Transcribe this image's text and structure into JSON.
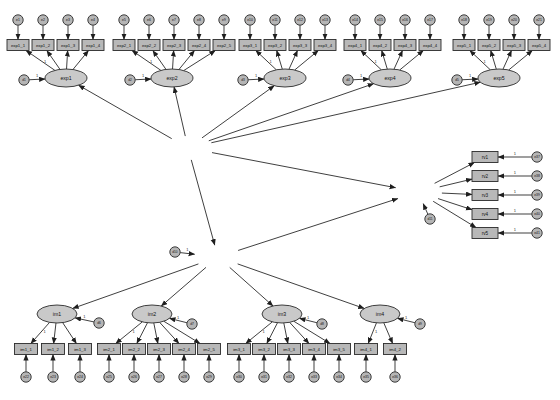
{
  "figure": {
    "kind": "sem-path-diagram",
    "title": "",
    "background_color": "#ffffff",
    "shape_fill_rect": "#b8b8b8",
    "shape_fill_ellipse": "#c9c9c9",
    "shape_fill_circle": "#b5b5b5",
    "stroke_color": "#1e1e1e",
    "edge_label": "1"
  },
  "latents": {
    "second_order": [
      {
        "id": "exp",
        "label": "exp",
        "x": 188,
        "y": 148,
        "rx": 26,
        "ry": 12
      },
      {
        "id": "im",
        "label": "im",
        "x": 218,
        "y": 257,
        "rx": 24,
        "ry": 12
      },
      {
        "id": "rv",
        "label": "rv",
        "x": 418,
        "y": 192,
        "rx": 24,
        "ry": 12
      }
    ],
    "first_order": [
      {
        "id": "exp1",
        "label": "exp1",
        "x": 66,
        "y": 78,
        "rx": 21,
        "ry": 9
      },
      {
        "id": "exp2",
        "label": "exp2",
        "x": 172,
        "y": 78,
        "rx": 21,
        "ry": 9
      },
      {
        "id": "exp3",
        "label": "exp3",
        "x": 285,
        "y": 78,
        "rx": 21,
        "ry": 9
      },
      {
        "id": "exp4",
        "label": "exp4",
        "x": 390,
        "y": 78,
        "rx": 21,
        "ry": 9
      },
      {
        "id": "exp5",
        "label": "exp5",
        "x": 499,
        "y": 78,
        "rx": 21,
        "ry": 9
      },
      {
        "id": "im1",
        "label": "im1",
        "x": 57,
        "y": 314,
        "rx": 20,
        "ry": 9
      },
      {
        "id": "im2",
        "label": "im2",
        "x": 152,
        "y": 314,
        "rx": 20,
        "ry": 9
      },
      {
        "id": "im3",
        "label": "im3",
        "x": 282,
        "y": 314,
        "rx": 20,
        "ry": 9
      },
      {
        "id": "im4",
        "label": "im4",
        "x": 380,
        "y": 314,
        "rx": 20,
        "ry": 9
      }
    ]
  },
  "indicator_groups": [
    {
      "factor": "exp1",
      "indicators": [
        "exp1_1",
        "exp1_2",
        "exp1_3",
        "exp1_4"
      ],
      "errors": [
        "e1",
        "e2",
        "e3",
        "e4"
      ],
      "disturbance": "d1",
      "box_y": 45,
      "err_y": 20,
      "x_start": 18,
      "x_step": 25,
      "box_w": 22,
      "box_h": 11
    },
    {
      "factor": "exp2",
      "indicators": [
        "exp2_1",
        "exp2_2",
        "exp2_3",
        "exp2_4",
        "exp2_5"
      ],
      "errors": [
        "e5",
        "e6",
        "e7",
        "e8",
        "e9"
      ],
      "disturbance": "d2",
      "box_y": 45,
      "err_y": 20,
      "x_start": 124,
      "x_step": 25,
      "box_w": 22,
      "box_h": 11
    },
    {
      "factor": "exp3",
      "indicators": [
        "exp3_1",
        "exp3_2",
        "exp3_3",
        "exp3_4"
      ],
      "errors": [
        "e10",
        "e11",
        "e12",
        "e13"
      ],
      "disturbance": "d3",
      "box_y": 45,
      "err_y": 20,
      "x_start": 250,
      "x_step": 25,
      "box_w": 22,
      "box_h": 11
    },
    {
      "factor": "exp4",
      "indicators": [
        "exp4_1",
        "exp4_2",
        "exp4_3",
        "exp4_4"
      ],
      "errors": [
        "e14",
        "e15",
        "e16",
        "e17"
      ],
      "disturbance": "d4",
      "box_y": 45,
      "err_y": 20,
      "x_start": 355,
      "x_step": 25,
      "box_w": 22,
      "box_h": 11
    },
    {
      "factor": "exp5",
      "indicators": [
        "exp5_1",
        "exp5_2",
        "exp5_3",
        "exp5_4"
      ],
      "errors": [
        "e18",
        "e19",
        "e20",
        "e21"
      ],
      "disturbance": "d5",
      "box_y": 45,
      "err_y": 20,
      "x_start": 464,
      "x_step": 25,
      "box_w": 22,
      "box_h": 11
    },
    {
      "factor": "im1",
      "indicators": [
        "im1_1",
        "im1_2",
        "im1_3"
      ],
      "errors": [
        "e22",
        "e23",
        "e24"
      ],
      "disturbance": "d6",
      "box_y": 349,
      "err_y": 377,
      "x_start": 26,
      "x_step": 27,
      "box_w": 23,
      "box_h": 11
    },
    {
      "factor": "im2",
      "indicators": [
        "im2_1",
        "im2_2",
        "im2_3",
        "im2_4",
        "im2_5"
      ],
      "errors": [
        "e25",
        "e26",
        "e27",
        "e28",
        "e29"
      ],
      "disturbance": "d7",
      "box_y": 349,
      "err_y": 377,
      "x_start": 109,
      "x_step": 25,
      "box_w": 23,
      "box_h": 11
    },
    {
      "factor": "im3",
      "indicators": [
        "im3_1",
        "im3_2",
        "im3_3",
        "im3_4",
        "im3_5"
      ],
      "errors": [
        "e30",
        "e31",
        "e32",
        "e33",
        "e34"
      ],
      "disturbance": "d8",
      "box_y": 349,
      "err_y": 377,
      "x_start": 239,
      "x_step": 25,
      "box_w": 23,
      "box_h": 11
    },
    {
      "factor": "im4",
      "indicators": [
        "im4_1",
        "im4_2"
      ],
      "errors": [
        "e35",
        "e36"
      ],
      "disturbance": "d9",
      "box_y": 349,
      "err_y": 377,
      "x_start": 366,
      "x_step": 29,
      "box_w": 23,
      "box_h": 11
    }
  ],
  "rv_block": {
    "factor": "rv",
    "indicators": [
      "rv1",
      "rv2",
      "rv3",
      "rv4",
      "rv5"
    ],
    "errors": [
      "e37",
      "e38",
      "e39",
      "e40",
      "e41"
    ],
    "disturbance": "d11",
    "box_x": 485,
    "box_w": 26,
    "box_h": 11,
    "err_x": 537,
    "y_start": 157,
    "y_step": 19
  },
  "im_disturbance": {
    "id": "d10",
    "x": 175,
    "y": 252
  },
  "structural_paths": [
    {
      "from": "exp",
      "to": "exp1",
      "label": ""
    },
    {
      "from": "exp",
      "to": "exp2",
      "label": ""
    },
    {
      "from": "exp",
      "to": "exp3",
      "label": ""
    },
    {
      "from": "exp",
      "to": "exp4",
      "label": ""
    },
    {
      "from": "exp",
      "to": "exp5",
      "label": ""
    },
    {
      "from": "exp",
      "to": "im",
      "label": ""
    },
    {
      "from": "exp",
      "to": "rv",
      "label": ""
    },
    {
      "from": "im",
      "to": "rv",
      "label": ""
    },
    {
      "from": "im",
      "to": "im1",
      "label": ""
    },
    {
      "from": "im",
      "to": "im2",
      "label": ""
    },
    {
      "from": "im",
      "to": "im3",
      "label": ""
    },
    {
      "from": "im",
      "to": "im4",
      "label": ""
    }
  ]
}
